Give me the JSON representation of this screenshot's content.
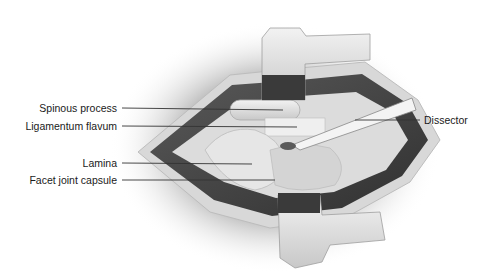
{
  "figure": {
    "labels": [
      {
        "id": "spinous_process",
        "text": "Spinous process",
        "side": "left",
        "label_x": 117,
        "label_y": 108,
        "target_x": 283,
        "target_y": 110
      },
      {
        "id": "ligamentum_flavum",
        "text": "Ligamentum flavum",
        "side": "left",
        "label_x": 117,
        "label_y": 126,
        "target_x": 297,
        "target_y": 127
      },
      {
        "id": "lamina",
        "text": "Lamina",
        "side": "left",
        "label_x": 117,
        "label_y": 163,
        "target_x": 252,
        "target_y": 164
      },
      {
        "id": "facet_joint_capsule",
        "text": "Facet joint capsule",
        "side": "left",
        "label_x": 117,
        "label_y": 180,
        "target_x": 275,
        "target_y": 180
      },
      {
        "id": "dissector",
        "text": "Dissector",
        "side": "right",
        "label_x": 424,
        "label_y": 120,
        "target_x": 355,
        "target_y": 120
      }
    ]
  },
  "colors": {
    "background": "#ffffff",
    "shadow": "#9a9a9a",
    "muscle": "#4a4a4a",
    "bone": "#e4e4e4",
    "fat": "#d6d6d6",
    "leader_line": "#333333",
    "text": "#1a1a1a"
  }
}
